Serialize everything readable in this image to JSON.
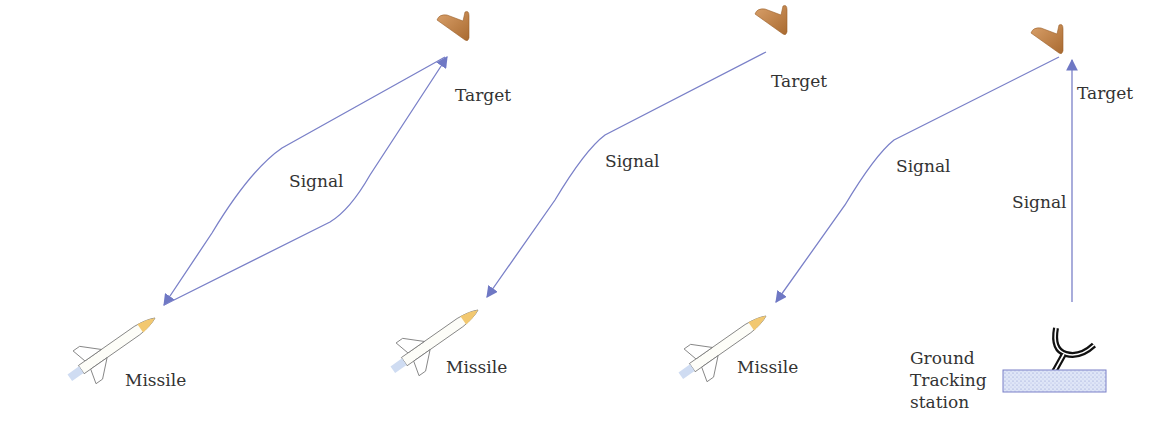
{
  "panels": [
    {
      "name": "semi-active-homing",
      "target_label": "Target",
      "signal_label": "Signal",
      "missile_label": "Missile"
    },
    {
      "name": "active-homing",
      "target_label": "Target",
      "signal_label": "Signal",
      "missile_label": "Missile"
    },
    {
      "name": "command-guidance",
      "target_label": "Target",
      "signal_label_upper": "Signal",
      "signal_label_ground": "Signal",
      "missile_label": "Missile",
      "station_label": [
        "Ground",
        "Tracking",
        "station"
      ]
    }
  ],
  "colors": {
    "signal_line": "#7a80c8",
    "target_fill": "#c98a4a",
    "missile_nose": "#f0c878",
    "station_box": "#c8d4f0",
    "station_border": "#7a80c8",
    "text": "#333333"
  }
}
